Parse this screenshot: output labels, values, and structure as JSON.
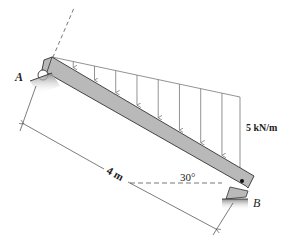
{
  "diagram": {
    "type": "inclined-beam-with-triangular-load",
    "labels": {
      "support_a": "A",
      "support_b": "B",
      "length": "4 m",
      "angle": "30°",
      "load_intensity": "5 kN/m"
    },
    "supports": [
      {
        "name": "A",
        "kind": "roller"
      },
      {
        "name": "B",
        "kind": "pin"
      }
    ],
    "beam": {
      "length_m": 4,
      "inclination_deg": 30
    },
    "distributed_load": {
      "shape": "triangular",
      "max_intensity_kN_per_m": 5,
      "max_at": "B",
      "arrow_count": 9
    },
    "colors": {
      "beam_fill": "#b9b9b9",
      "line": "#333333",
      "load_line": "#777777",
      "ground_shade": "#9a9a9a"
    }
  }
}
